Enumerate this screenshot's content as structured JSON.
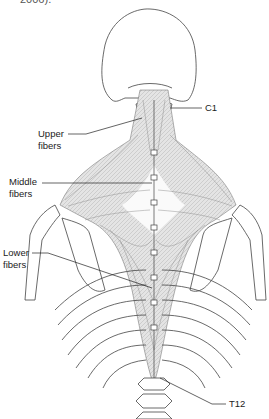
{
  "caption_fragment": "2006).",
  "figure": {
    "labels": {
      "upper": [
        "Upper",
        "fibers"
      ],
      "middle": [
        "Middle",
        "fibers"
      ],
      "lower": [
        "Lower",
        "fibers"
      ],
      "c1": "C1",
      "t12": "T12"
    },
    "colors": {
      "line": "#333333",
      "muscle_fill": "#d9d9d9",
      "muscle_light": "#f2f2f2",
      "background": "#ffffff"
    }
  }
}
